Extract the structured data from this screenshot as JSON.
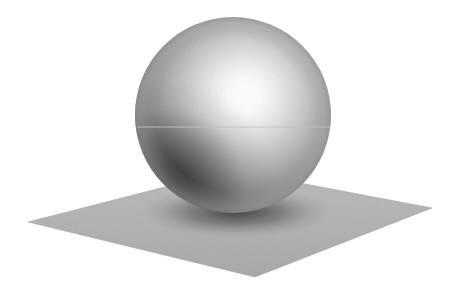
{
  "figure": {
    "title": "Raytraced sphere resting on a ground plane",
    "kind": "3d-render",
    "renderer_style": "ray-traced grayscale with film grain",
    "width_px": 462,
    "height_px": 290,
    "background_color": "#ffffff"
  },
  "scene": {
    "objects": [
      {
        "name": "sphere",
        "shape": "sphere",
        "center_px": [
          233,
          115
        ],
        "radius_px": 98,
        "bounds_px": {
          "left": 135,
          "top": 17,
          "right": 331,
          "bottom": 213
        },
        "material": "matte-to-glossy gray",
        "base_color": "#8a8a8a",
        "highlight_color": "#ffffff",
        "terminator_color": "#0d0d0d",
        "rim_color": "#9a9a9a"
      },
      {
        "name": "ground-plane",
        "shape": "quadrilateral",
        "corners_px": {
          "left": [
            28,
            222
          ],
          "bottom": [
            255,
            277
          ],
          "right": [
            432,
            208
          ],
          "back": [
            231,
            170
          ]
        },
        "fill_color": "#b4b4b4",
        "edge_color": "#a8a8a8"
      },
      {
        "name": "contact-shadow",
        "shape": "ellipse",
        "center_px": [
          236,
          212
        ],
        "radii_px": [
          96,
          26
        ],
        "color": "#3a3a3a",
        "note": "darkening of the plane directly beneath the sphere"
      }
    ],
    "light": {
      "name": "key-light",
      "type": "point",
      "specular_highlight_px": [
        245,
        95
      ],
      "highlight_radius_px": 30,
      "direction": "upper-right, in front of sphere"
    },
    "artifacts": [
      {
        "name": "scanline-seam",
        "type": "horizontal-line",
        "y_px": 127,
        "x_start_px": 137,
        "x_end_px": 330,
        "color": "#c8c8c8",
        "note": "faint bright horizontal seam crossing the sphere"
      }
    ],
    "gradient_stops": {
      "sphere_radial": [
        {
          "offset": "0%",
          "color": "#ffffff"
        },
        {
          "offset": "9%",
          "color": "#fbfbfb"
        },
        {
          "offset": "18%",
          "color": "#eeeeee"
        },
        {
          "offset": "30%",
          "color": "#d4d4d4"
        },
        {
          "offset": "44%",
          "color": "#b2b2b2"
        },
        {
          "offset": "58%",
          "color": "#8d8d8d"
        },
        {
          "offset": "70%",
          "color": "#6a6a6a"
        },
        {
          "offset": "82%",
          "color": "#434343"
        },
        {
          "offset": "92%",
          "color": "#232323"
        },
        {
          "offset": "100%",
          "color": "#101010"
        }
      ],
      "sphere_rim_stops": [
        {
          "offset": "78%",
          "color": "rgba(160,160,160,0)"
        },
        {
          "offset": "94%",
          "color": "rgba(168,168,168,0.45)"
        },
        {
          "offset": "100%",
          "color": "rgba(150,150,150,0.65)"
        }
      ],
      "plane_stops": [
        {
          "offset": "0%",
          "color": "#bdbdbd"
        },
        {
          "offset": "55%",
          "color": "#b4b4b4"
        },
        {
          "offset": "100%",
          "color": "#ababab"
        }
      ]
    }
  }
}
